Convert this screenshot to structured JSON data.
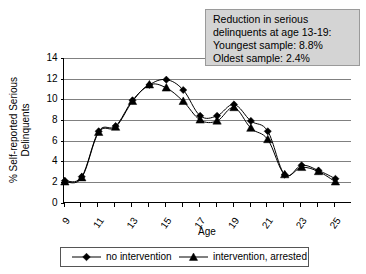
{
  "chart_data": {
    "type": "line",
    "title": "",
    "xlabel": "Age",
    "ylabel": "% Self-reported Serious Delinquents",
    "ylabel_line1": "% Self-reported Serious",
    "ylabel_line2": "Delinquents",
    "ylim": [
      0,
      14
    ],
    "ytick_step": 2,
    "yticks": [
      "0",
      "2",
      "4",
      "6",
      "8",
      "10",
      "12",
      "14"
    ],
    "xlim": [
      9,
      25
    ],
    "x": [
      9,
      10,
      11,
      12,
      13,
      14,
      15,
      16,
      17,
      18,
      19,
      20,
      21,
      22,
      23,
      24,
      25
    ],
    "xticks": [
      "9",
      "11",
      "13",
      "15",
      "17",
      "19",
      "21",
      "23",
      "25"
    ],
    "xtick_values": [
      9,
      11,
      13,
      15,
      17,
      19,
      21,
      23,
      25
    ],
    "grid": "horizontal",
    "legend_position": "bottom",
    "series": [
      {
        "name": "no intervention",
        "marker": "diamond",
        "values": [
          2.1,
          2.5,
          6.9,
          7.4,
          9.9,
          11.4,
          11.9,
          10.9,
          8.4,
          8.4,
          9.5,
          7.9,
          6.9,
          2.7,
          3.6,
          3.1,
          2.3
        ]
      },
      {
        "name": "intervention, arrested",
        "marker": "triangle",
        "values": [
          2.0,
          2.4,
          6.8,
          7.3,
          9.8,
          11.4,
          11.1,
          9.8,
          8.0,
          7.9,
          9.2,
          7.2,
          6.1,
          2.7,
          3.4,
          3.0,
          2.0
        ]
      }
    ]
  },
  "annotation": {
    "line1": "Reduction in serious",
    "line2": "delinquents at age 13-19:",
    "line3": "Youngest sample: 8.8%",
    "line4": "Oldest sample: 2.4%",
    "fill_color": "#d4d4d4",
    "border_color": "#9a9a9a"
  },
  "legend": {
    "items": [
      {
        "label": "no intervention",
        "marker": "diamond"
      },
      {
        "label": "intervention, arrested",
        "marker": "triangle"
      }
    ]
  },
  "colors": {
    "series": "#000000",
    "gridline": "#808080",
    "axis": "#000000",
    "background": "#ffffff"
  }
}
